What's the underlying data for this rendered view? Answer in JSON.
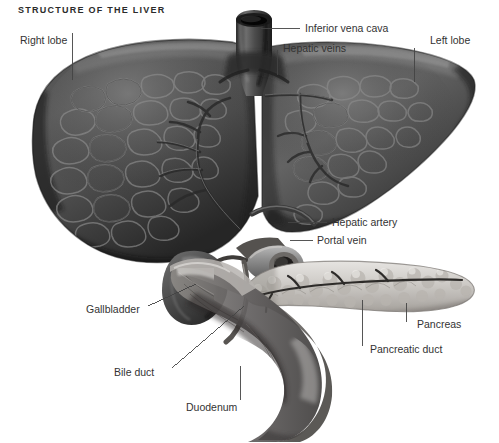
{
  "figure": {
    "title": "STRUCTURE OF THE LIVER",
    "type": "anatomical-illustration",
    "subject": "liver",
    "style": "grayscale airbrush medical illustration",
    "background_color": "#ffffff",
    "label_color": "#333333",
    "title_color": "#2b2b2b"
  },
  "labels": {
    "right_lobe": "Right lobe",
    "inferior_vena_cava": "Inferior vena cava",
    "hepatic_veins": "Hepatic veins",
    "left_lobe": "Left lobe",
    "hepatic_artery": "Hepatic artery",
    "portal_vein": "Portal vein",
    "gallbladder": "Gallbladder",
    "pancreas": "Pancreas",
    "pancreatic_duct": "Pancreatic duct",
    "bile_duct": "Bile duct",
    "duodenum": "Duodenum"
  },
  "structures": [
    {
      "name": "right-lobe",
      "label": "Right lobe",
      "tone": "dark-gray",
      "texture": "hepatic lobules"
    },
    {
      "name": "left-lobe",
      "label": "Left lobe",
      "tone": "dark-gray",
      "texture": "hepatic lobules"
    },
    {
      "name": "inferior-vena-cava",
      "label": "Inferior vena cava",
      "tone": "very-dark",
      "texture": "cut tube with lumen"
    },
    {
      "name": "hepatic-veins",
      "label": "Hepatic veins",
      "tone": "dark",
      "texture": "branching tree"
    },
    {
      "name": "hepatic-artery",
      "label": "Hepatic artery",
      "tone": "mid-gray",
      "texture": "vessel"
    },
    {
      "name": "portal-vein",
      "label": "Portal vein",
      "tone": "mid-gray",
      "texture": "cut tube with lumen"
    },
    {
      "name": "gallbladder",
      "label": "Gallbladder",
      "tone": "dark",
      "texture": "pear-shaped sac"
    },
    {
      "name": "pancreas",
      "label": "Pancreas",
      "tone": "light-gray",
      "texture": "lobulated bumpy"
    },
    {
      "name": "pancreatic-duct",
      "label": "Pancreatic duct",
      "tone": "dark-line",
      "texture": "duct channel"
    },
    {
      "name": "bile-duct",
      "label": "Bile duct",
      "tone": "mid-gray",
      "texture": "duct"
    },
    {
      "name": "duodenum",
      "label": "Duodenum",
      "tone": "mid-gray",
      "texture": "C-loop bowel"
    }
  ]
}
